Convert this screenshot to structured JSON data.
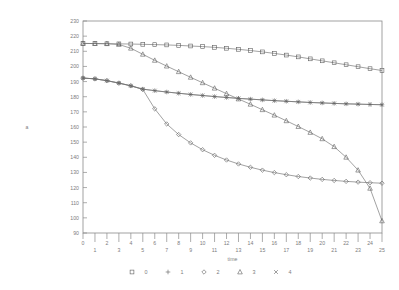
{
  "chart_data": {
    "type": "line",
    "title": "",
    "xlabel": "time",
    "ylabel": "a",
    "xlim": [
      0,
      25
    ],
    "ylim": [
      90,
      230
    ],
    "ytick_step": 10,
    "xtick_step": 1,
    "grid": false,
    "legend_position": "bottom",
    "x": [
      0,
      1,
      2,
      3,
      4,
      5,
      6,
      7,
      8,
      9,
      10,
      11,
      12,
      13,
      14,
      15,
      16,
      17,
      18,
      19,
      20,
      21,
      22,
      23,
      24,
      25
    ],
    "xticklabels": [
      "0",
      "1",
      "2",
      "3",
      "4",
      "5",
      "6",
      "7",
      "8",
      "9",
      "10",
      "11",
      "12",
      "13",
      "14",
      "15",
      "16",
      "17",
      "18",
      "19",
      "20",
      "21",
      "22",
      "23",
      "24",
      "25"
    ],
    "yticklabels": [
      "90",
      "100",
      "110",
      "120",
      "130",
      "140",
      "150",
      "160",
      "170",
      "180",
      "190",
      "200",
      "210",
      "220",
      "230"
    ],
    "series": [
      {
        "name": "0",
        "marker": "square",
        "values": [
          215.2,
          215.1,
          215.0,
          214.9,
          214.8,
          214.6,
          214.4,
          214.2,
          213.9,
          213.5,
          213.1,
          212.6,
          212.0,
          211.3,
          210.5,
          209.6,
          208.6,
          207.5,
          206.3,
          205.0,
          203.7,
          202.4,
          201.1,
          199.8,
          198.5,
          197.3
        ]
      },
      {
        "name": "1",
        "marker": "plus",
        "values": [
          192.3,
          191.8,
          190.6,
          189.0,
          187.2,
          185.0,
          184.0,
          183.1,
          182.3,
          181.5,
          180.8,
          180.1,
          179.5,
          178.9,
          178.4,
          177.9,
          177.4,
          177.0,
          176.6,
          176.2,
          175.9,
          175.6,
          175.3,
          175.1,
          174.9,
          174.7
        ]
      },
      {
        "name": "2",
        "marker": "diamond",
        "values": [
          192.3,
          191.8,
          190.6,
          189.0,
          187.2,
          184.8,
          172.0,
          162.0,
          155.0,
          149.5,
          145.0,
          141.3,
          138.2,
          135.6,
          133.4,
          131.5,
          129.9,
          128.5,
          127.3,
          126.3,
          125.4,
          124.7,
          124.1,
          123.6,
          123.2,
          122.9
        ]
      },
      {
        "name": "3",
        "marker": "triangle",
        "values": [
          215.2,
          215.1,
          215.0,
          214.5,
          212.0,
          208.0,
          204.0,
          200.2,
          196.5,
          192.8,
          189.2,
          185.6,
          182.0,
          178.5,
          175.0,
          171.4,
          167.8,
          164.1,
          160.3,
          156.4,
          152.2,
          147.0,
          140.0,
          131.5,
          119.5,
          98.0
        ]
      },
      {
        "name": "4",
        "marker": "cross",
        "values": [
          192.3,
          191.8,
          190.6,
          189.0,
          187.2,
          185.0,
          184.0,
          183.1,
          182.3,
          181.5,
          180.8,
          180.1,
          179.5,
          178.9,
          178.4,
          177.9,
          177.4,
          177.0,
          176.6,
          176.2,
          175.9,
          175.6,
          175.3,
          175.1,
          174.9,
          174.7
        ]
      }
    ]
  },
  "legend": {
    "entries": [
      {
        "marker": "square",
        "label": "0"
      },
      {
        "marker": "plus",
        "label": "1"
      },
      {
        "marker": "diamond",
        "label": "2"
      },
      {
        "marker": "triangle",
        "label": "3"
      },
      {
        "marker": "cross",
        "label": "4"
      }
    ]
  },
  "colors": {
    "axis": "#8a8a8a",
    "text": "#7d7d7d",
    "line": "#6f6f6f",
    "marker": "#5e5e5e",
    "background": "#ffffff"
  }
}
